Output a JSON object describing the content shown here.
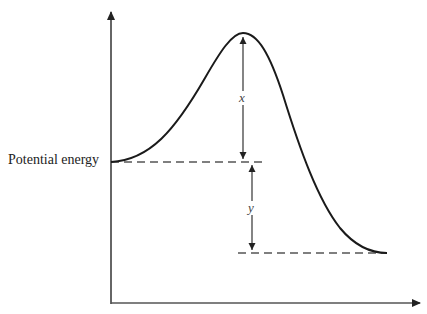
{
  "diagram": {
    "type": "energy-profile",
    "y_axis_label": "Potential energy",
    "x_axis_label": "",
    "annotations": {
      "x_label": "x",
      "y_label": "y"
    }
  }
}
